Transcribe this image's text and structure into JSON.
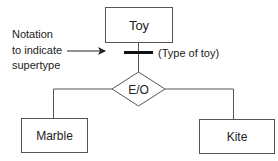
{
  "diagram": {
    "type": "EER supertype/subtype diagram",
    "supertype": {
      "label": "Toy"
    },
    "discriminator_label": "(Type of toy)",
    "constraint": {
      "label": "E/O",
      "meaning": "exclusive / overlapping"
    },
    "subtypes": [
      {
        "label": "Marble"
      },
      {
        "label": "Kite"
      }
    ],
    "annotation": {
      "lines": [
        "Notation",
        "to indicate",
        "supertype"
      ]
    }
  }
}
